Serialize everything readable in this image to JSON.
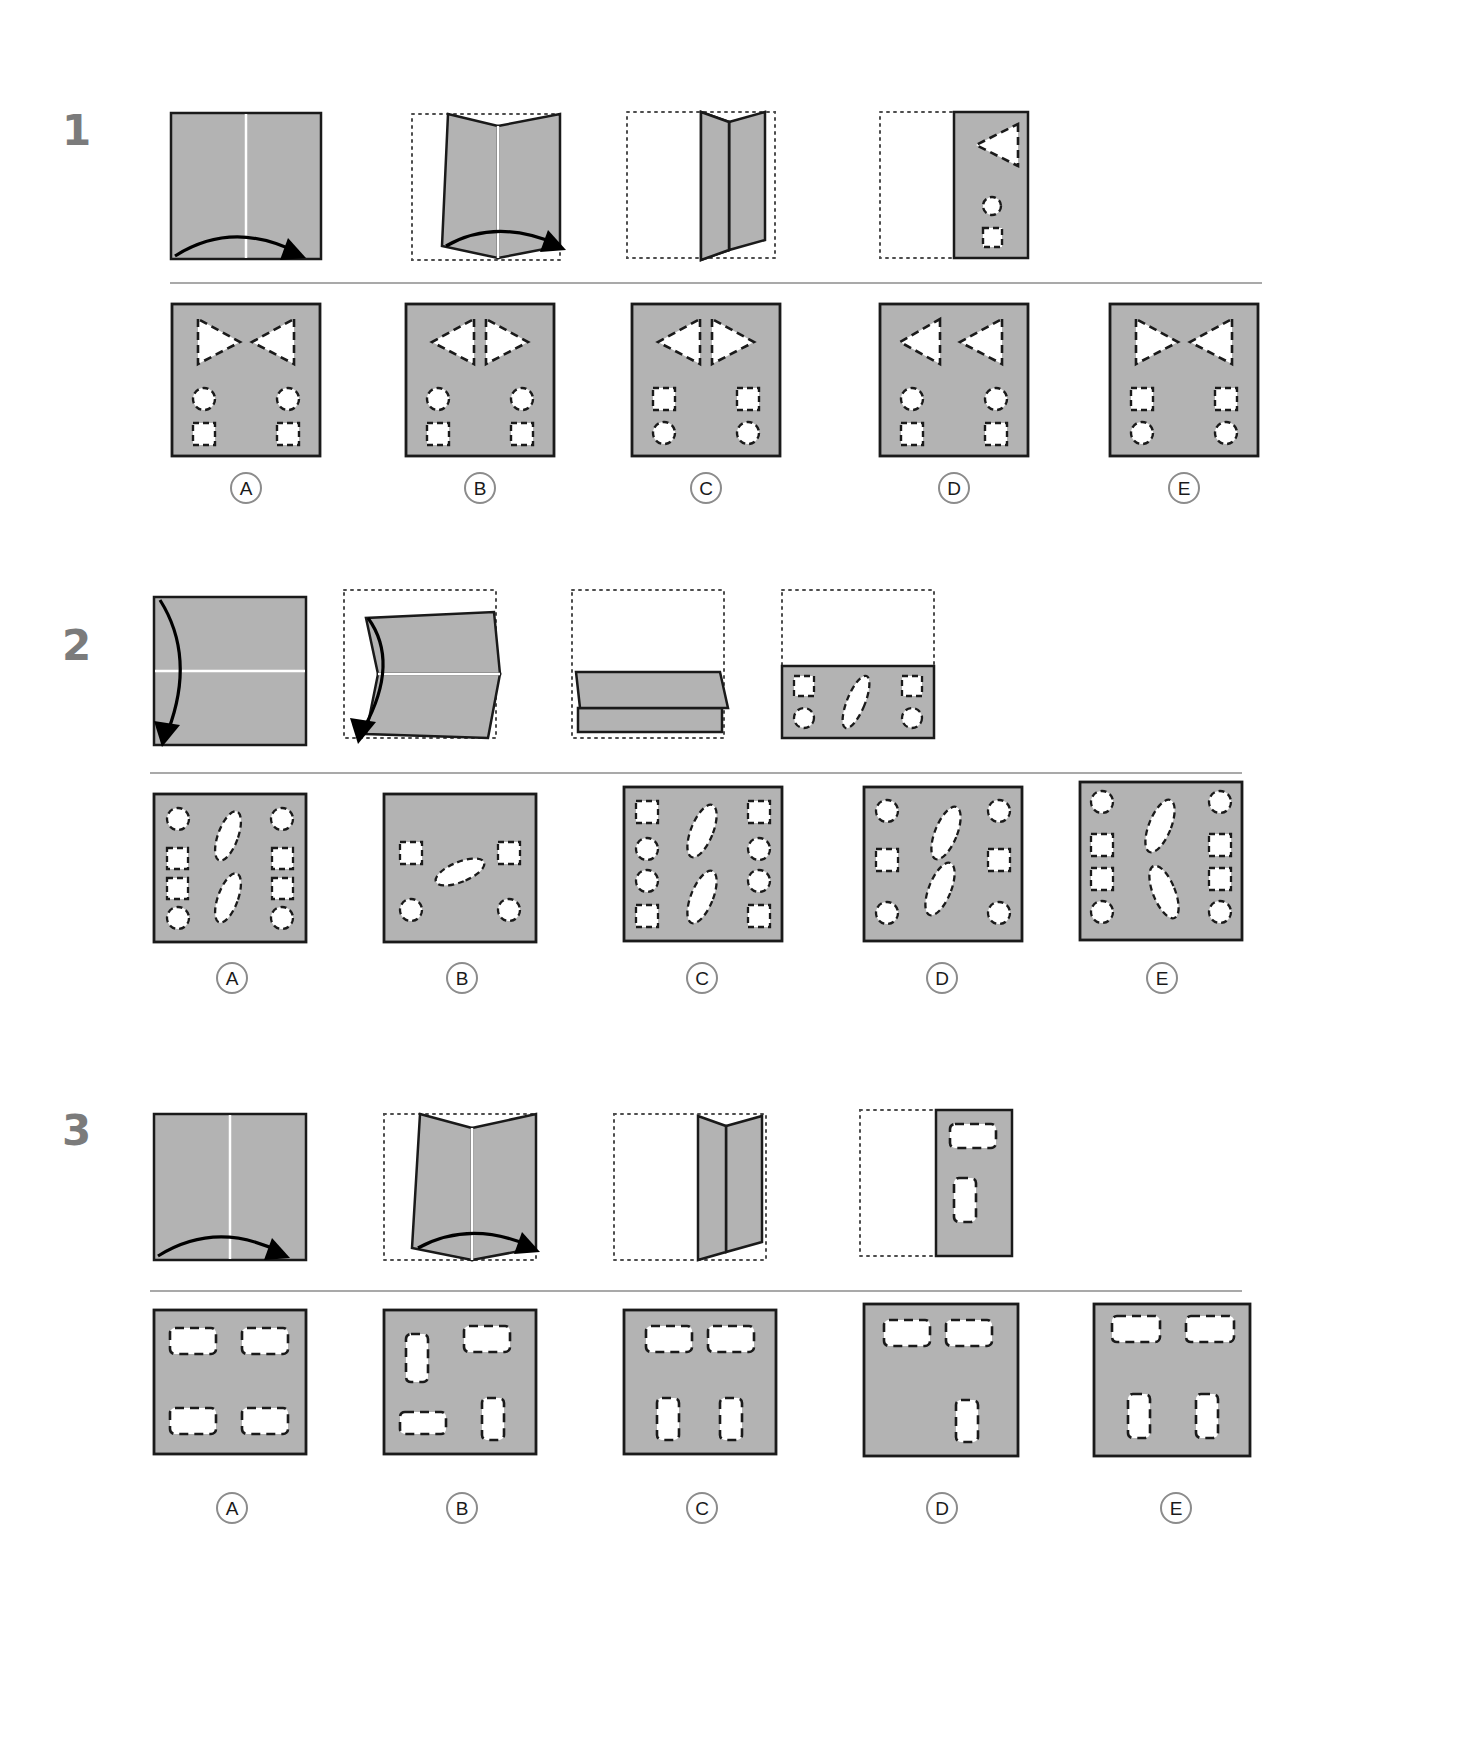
{
  "page": {
    "background_color": "#ffffff",
    "paper_fill": "#b3b3b3",
    "paper_stroke": "#1a1a1a",
    "hole_fill": "#ffffff",
    "hole_stroke": "#1a1a1a",
    "ghost_stroke": "#4d4d4d",
    "divider_color": "#a9a9a9",
    "qnum_color": "#7b7b7b"
  },
  "questions": [
    {
      "number": "1",
      "fold_sequence": [
        {
          "step": "1",
          "kind": "flat-square-vertical-crease",
          "arrow": "bottom-left-to-bottom-right-arc",
          "caption": ""
        },
        {
          "step": "2",
          "kind": "partially-folded-book-vertical",
          "arrow": "bottom-left-to-bottom-right-arc",
          "ghost_outline": true,
          "caption": ""
        },
        {
          "step": "3",
          "kind": "folded-upright-book-vertical",
          "ghost_outline": true,
          "caption": ""
        },
        {
          "step": "4",
          "kind": "folded-half-with-punches",
          "ghost_outline": true,
          "caption": "",
          "punches": [
            {
              "shape": "triangle-left",
              "x": 0.6,
              "y": 0.22,
              "size": 0.26
            },
            {
              "shape": "circle",
              "x": 0.72,
              "y": 0.62,
              "size": 0.11
            },
            {
              "shape": "square",
              "x": 0.72,
              "y": 0.82,
              "size": 0.12
            }
          ]
        }
      ],
      "options": [
        {
          "label": "A",
          "punches": [
            {
              "shape": "triangle-right",
              "x": 0.27,
              "y": 0.22
            },
            {
              "shape": "triangle-left",
              "x": 0.73,
              "y": 0.22
            },
            {
              "shape": "circle",
              "x": 0.22,
              "y": 0.62
            },
            {
              "shape": "circle",
              "x": 0.78,
              "y": 0.62
            },
            {
              "shape": "square",
              "x": 0.22,
              "y": 0.83
            },
            {
              "shape": "square",
              "x": 0.78,
              "y": 0.83
            }
          ]
        },
        {
          "label": "B",
          "punches": [
            {
              "shape": "triangle-left",
              "x": 0.33,
              "y": 0.22
            },
            {
              "shape": "triangle-right",
              "x": 0.63,
              "y": 0.22
            },
            {
              "shape": "circle",
              "x": 0.22,
              "y": 0.62
            },
            {
              "shape": "circle",
              "x": 0.78,
              "y": 0.62
            },
            {
              "shape": "square",
              "x": 0.22,
              "y": 0.83
            },
            {
              "shape": "square",
              "x": 0.78,
              "y": 0.83
            }
          ]
        },
        {
          "label": "C",
          "punches": [
            {
              "shape": "triangle-left",
              "x": 0.33,
              "y": 0.22
            },
            {
              "shape": "triangle-right",
              "x": 0.63,
              "y": 0.22
            },
            {
              "shape": "square",
              "x": 0.22,
              "y": 0.62
            },
            {
              "shape": "square",
              "x": 0.78,
              "y": 0.62
            },
            {
              "shape": "circle",
              "x": 0.22,
              "y": 0.83
            },
            {
              "shape": "circle",
              "x": 0.78,
              "y": 0.83
            }
          ]
        },
        {
          "label": "D",
          "punches": [
            {
              "shape": "triangle-left",
              "x": 0.27,
              "y": 0.22
            },
            {
              "shape": "triangle-left",
              "x": 0.7,
              "y": 0.22
            },
            {
              "shape": "circle",
              "x": 0.22,
              "y": 0.62
            },
            {
              "shape": "circle",
              "x": 0.78,
              "y": 0.62
            },
            {
              "shape": "square",
              "x": 0.22,
              "y": 0.83
            },
            {
              "shape": "square",
              "x": 0.78,
              "y": 0.83
            }
          ]
        },
        {
          "label": "E",
          "punches": [
            {
              "shape": "triangle-right",
              "x": 0.27,
              "y": 0.22
            },
            {
              "shape": "triangle-left",
              "x": 0.73,
              "y": 0.22
            },
            {
              "shape": "square",
              "x": 0.22,
              "y": 0.62
            },
            {
              "shape": "square",
              "x": 0.78,
              "y": 0.62
            },
            {
              "shape": "circle",
              "x": 0.22,
              "y": 0.83
            },
            {
              "shape": "circle",
              "x": 0.78,
              "y": 0.83
            }
          ]
        }
      ]
    },
    {
      "number": "2",
      "fold_sequence": [
        {
          "step": "1",
          "kind": "flat-square-horizontal-crease",
          "arrow": "top-left-to-bottom-left-arc",
          "caption": ""
        },
        {
          "step": "2",
          "kind": "partially-folded-book-horizontal",
          "arrow": "top-left-to-bottom-left-arc",
          "ghost_outline": true,
          "caption": ""
        },
        {
          "step": "3",
          "kind": "folded-flat-book-horizontal",
          "ghost_outline": true,
          "caption": ""
        },
        {
          "step": "4",
          "kind": "folded-half-with-punches-horizontal",
          "ghost_outline": true,
          "caption": "",
          "punches": [
            {
              "shape": "square",
              "x": 0.16,
              "y": 0.3
            },
            {
              "shape": "ellipse-diagonal",
              "x": 0.5,
              "y": 0.45
            },
            {
              "shape": "square",
              "x": 0.84,
              "y": 0.3
            },
            {
              "shape": "circle",
              "x": 0.16,
              "y": 0.72
            },
            {
              "shape": "circle",
              "x": 0.84,
              "y": 0.72
            }
          ]
        }
      ],
      "options": [
        {
          "label": "A",
          "punches": [
            {
              "shape": "circle",
              "x": 0.14,
              "y": 0.13
            },
            {
              "shape": "ellipse-diagonal",
              "x": 0.5,
              "y": 0.27
            },
            {
              "shape": "circle",
              "x": 0.86,
              "y": 0.13
            },
            {
              "shape": "square",
              "x": 0.14,
              "y": 0.42
            },
            {
              "shape": "square",
              "x": 0.86,
              "y": 0.42
            },
            {
              "shape": "square",
              "x": 0.14,
              "y": 0.62
            },
            {
              "shape": "square",
              "x": 0.86,
              "y": 0.62
            },
            {
              "shape": "ellipse-diagonal",
              "x": 0.5,
              "y": 0.74
            },
            {
              "shape": "circle",
              "x": 0.14,
              "y": 0.88
            },
            {
              "shape": "circle",
              "x": 0.86,
              "y": 0.88
            }
          ]
        },
        {
          "label": "B",
          "punches": [
            {
              "shape": "square",
              "x": 0.17,
              "y": 0.37
            },
            {
              "shape": "ellipse-diagonal",
              "x": 0.5,
              "y": 0.52
            },
            {
              "shape": "square",
              "x": 0.83,
              "y": 0.37
            },
            {
              "shape": "circle",
              "x": 0.17,
              "y": 0.78
            },
            {
              "shape": "circle",
              "x": 0.83,
              "y": 0.78
            }
          ]
        },
        {
          "label": "C",
          "punches": [
            {
              "shape": "square",
              "x": 0.13,
              "y": 0.15
            },
            {
              "shape": "ellipse-diagonal",
              "x": 0.5,
              "y": 0.3
            },
            {
              "shape": "square",
              "x": 0.87,
              "y": 0.15
            },
            {
              "shape": "circle",
              "x": 0.13,
              "y": 0.42
            },
            {
              "shape": "circle",
              "x": 0.87,
              "y": 0.42
            },
            {
              "shape": "circle",
              "x": 0.13,
              "y": 0.62
            },
            {
              "shape": "circle",
              "x": 0.87,
              "y": 0.62
            },
            {
              "shape": "ellipse-diagonal",
              "x": 0.5,
              "y": 0.72
            },
            {
              "shape": "square",
              "x": 0.13,
              "y": 0.88
            },
            {
              "shape": "square",
              "x": 0.87,
              "y": 0.88
            }
          ]
        },
        {
          "label": "D",
          "punches": [
            {
              "shape": "circle",
              "x": 0.13,
              "y": 0.15
            },
            {
              "shape": "ellipse-diagonal-alt",
              "x": 0.52,
              "y": 0.3
            },
            {
              "shape": "circle",
              "x": 0.87,
              "y": 0.15
            },
            {
              "shape": "square",
              "x": 0.13,
              "y": 0.47
            },
            {
              "shape": "square",
              "x": 0.87,
              "y": 0.47
            },
            {
              "shape": "ellipse-diagonal",
              "x": 0.5,
              "y": 0.68
            },
            {
              "shape": "circle",
              "x": 0.13,
              "y": 0.85
            },
            {
              "shape": "circle",
              "x": 0.87,
              "y": 0.85
            }
          ]
        },
        {
          "label": "E",
          "punches": [
            {
              "shape": "circle",
              "x": 0.13,
              "y": 0.13
            },
            {
              "shape": "ellipse-diagonal",
              "x": 0.5,
              "y": 0.28
            },
            {
              "shape": "circle",
              "x": 0.87,
              "y": 0.13
            },
            {
              "shape": "square",
              "x": 0.13,
              "y": 0.4
            },
            {
              "shape": "square",
              "x": 0.87,
              "y": 0.4
            },
            {
              "shape": "square",
              "x": 0.13,
              "y": 0.6
            },
            {
              "shape": "square",
              "x": 0.87,
              "y": 0.6
            },
            {
              "shape": "ellipse-diagonal-alt",
              "x": 0.52,
              "y": 0.72
            },
            {
              "shape": "circle",
              "x": 0.13,
              "y": 0.87
            },
            {
              "shape": "circle",
              "x": 0.87,
              "y": 0.87
            }
          ]
        }
      ]
    },
    {
      "number": "3",
      "fold_sequence": [
        {
          "step": "1",
          "kind": "flat-square-vertical-crease",
          "arrow": "bottom-left-to-bottom-right-arc",
          "caption": ""
        },
        {
          "step": "2",
          "kind": "partially-folded-book-vertical",
          "arrow": "bottom-left-to-bottom-right-arc",
          "ghost_outline": true,
          "caption": ""
        },
        {
          "step": "3",
          "kind": "folded-upright-book-vertical",
          "ghost_outline": true,
          "caption": ""
        },
        {
          "step": "4",
          "kind": "folded-half-with-punches",
          "ghost_outline": true,
          "caption": "",
          "punches": [
            {
              "shape": "rect-wide",
              "x": 0.58,
              "y": 0.16
            },
            {
              "shape": "rect-tall",
              "x": 0.48,
              "y": 0.57
            }
          ]
        }
      ],
      "options": [
        {
          "label": "A",
          "punches": [
            {
              "shape": "rect-wide",
              "x": 0.25,
              "y": 0.2
            },
            {
              "shape": "rect-wide",
              "x": 0.72,
              "y": 0.2
            },
            {
              "shape": "rect-wide",
              "x": 0.25,
              "y": 0.76
            },
            {
              "shape": "rect-wide",
              "x": 0.72,
              "y": 0.76
            }
          ]
        },
        {
          "label": "B",
          "punches": [
            {
              "shape": "rect-tall",
              "x": 0.22,
              "y": 0.27
            },
            {
              "shape": "rect-wide",
              "x": 0.68,
              "y": 0.18
            },
            {
              "shape": "rect-wide",
              "x": 0.27,
              "y": 0.8
            },
            {
              "shape": "rect-tall",
              "x": 0.73,
              "y": 0.75
            }
          ]
        },
        {
          "label": "C",
          "punches": [
            {
              "shape": "rect-wide",
              "x": 0.28,
              "y": 0.18
            },
            {
              "shape": "rect-wide",
              "x": 0.7,
              "y": 0.18
            },
            {
              "shape": "rect-tall",
              "x": 0.3,
              "y": 0.75
            },
            {
              "shape": "rect-tall",
              "x": 0.7,
              "y": 0.75
            }
          ]
        },
        {
          "label": "D",
          "punches": [
            {
              "shape": "rect-wide",
              "x": 0.26,
              "y": 0.18
            },
            {
              "shape": "rect-wide",
              "x": 0.64,
              "y": 0.18
            },
            {
              "shape": "rect-tall",
              "x": 0.68,
              "y": 0.75
            }
          ]
        },
        {
          "label": "E",
          "punches": [
            {
              "shape": "rect-wide",
              "x": 0.26,
              "y": 0.15
            },
            {
              "shape": "rect-wide",
              "x": 0.72,
              "y": 0.15
            },
            {
              "shape": "rect-tall",
              "x": 0.3,
              "y": 0.72
            },
            {
              "shape": "rect-tall",
              "x": 0.72,
              "y": 0.72
            }
          ]
        }
      ]
    }
  ]
}
